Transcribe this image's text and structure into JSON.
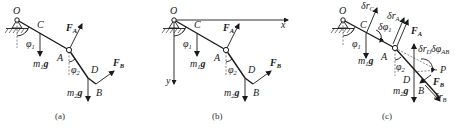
{
  "figure": {
    "panels": [
      {
        "id": "a",
        "caption": "(a)",
        "points": {
          "O": "O",
          "C": "C",
          "A": "A",
          "D": "D",
          "B": "B"
        },
        "forces": {
          "FA": "F",
          "FA_sub": "A",
          "FB": "F",
          "FB_sub": "B",
          "m1g": "m",
          "m1g_sub": "1",
          "m1g_g": "g",
          "m2g": "m",
          "m2g_sub": "2",
          "m2g_g": "g"
        },
        "angles": {
          "phi1": "φ",
          "phi1_sub": "1",
          "phi2": "φ",
          "phi2_sub": "2"
        }
      },
      {
        "id": "b",
        "caption": "(b)",
        "points": {
          "O": "O",
          "C": "C",
          "A": "A",
          "D": "D",
          "B": "B"
        },
        "axes": {
          "x": "x",
          "y": "y"
        },
        "forces": {
          "FA": "F",
          "FA_sub": "A",
          "FB": "F",
          "FB_sub": "B",
          "m1g": "m",
          "m1g_sub": "1",
          "m1g_g": "g",
          "m2g": "m",
          "m2g_sub": "2",
          "m2g_g": "g"
        },
        "angles": {
          "phi1": "φ",
          "phi1_sub": "1",
          "phi2": "φ",
          "phi2_sub": "2"
        }
      },
      {
        "id": "c",
        "caption": "(c)",
        "points": {
          "O": "O",
          "C": "C",
          "A": "A",
          "D": "D",
          "B": "B",
          "P": "P"
        },
        "forces": {
          "FA": "F",
          "FA_sub": "A",
          "FB": "F",
          "FB_sub": "B",
          "m1g": "m",
          "m1g_sub": "1",
          "m1g_g": "g",
          "m2g": "m",
          "m2g_sub": "2",
          "m2g_g": "g"
        },
        "angles": {
          "phi1": "φ",
          "phi1_sub": "1",
          "phi2": "φ",
          "phi2_sub": "2"
        },
        "virtual": {
          "drC": "δr",
          "drC_sub": "C",
          "drA": "δr",
          "drA_sub": "A",
          "drD": "δr",
          "drD_sub": "D",
          "drB": "δr",
          "drB_sub": "B",
          "dphi1": "δφ",
          "dphi1_sub": "1",
          "dphiAB": "δφ",
          "dphiAB_sub": "AB"
        }
      }
    ]
  }
}
